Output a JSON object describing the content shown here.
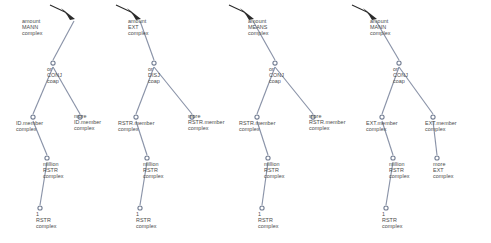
{
  "figure": {
    "type": "parse-tree-set",
    "tree_count": 4,
    "background_bleed_text": "the following image contains faint reverse-side text bleed-through from the scanned page"
  },
  "colors": {
    "edge": "#8a93a8",
    "node_stroke": "#6f7a90",
    "node_fill": "#ffffff",
    "root_marker": "#2b2b2b",
    "label_text": "#4a4a4a",
    "page_background": "#ffffff"
  },
  "trees": [
    {
      "id": "tree-1",
      "nodes": [
        {
          "id": "t1-root",
          "marker": "arrow",
          "x": 74,
          "y": 17,
          "label": [
            "amount",
            "MANN",
            "complex"
          ],
          "label_x": 22,
          "label_y": 18
        },
        {
          "id": "t1-or",
          "marker": "circle",
          "x": 53,
          "y": 63,
          "label": [
            "or",
            "CONJ",
            "coap"
          ],
          "label_x": 47,
          "label_y": 66
        },
        {
          "id": "t1-left",
          "marker": "circle",
          "x": 33,
          "y": 117,
          "label": [
            "ID.member",
            "complex"
          ],
          "label_x": 16,
          "label_y": 120
        },
        {
          "id": "t1-right",
          "marker": "circle",
          "x": 80,
          "y": 117,
          "label": [
            "more",
            "ID.member",
            "complex"
          ],
          "label_x": 74,
          "label_y": 113
        },
        {
          "id": "t1-million",
          "marker": "circle",
          "x": 47,
          "y": 158,
          "label": [
            "million",
            "RSTR",
            "complex"
          ],
          "label_x": 43,
          "label_y": 161
        },
        {
          "id": "t1-one",
          "marker": "circle",
          "x": 40,
          "y": 208,
          "label": [
            "1",
            "RSTR",
            "complex"
          ],
          "label_x": 36,
          "label_y": 211
        }
      ],
      "edges": [
        {
          "from": "t1-root",
          "to": "t1-or"
        },
        {
          "from": "t1-or",
          "to": "t1-left"
        },
        {
          "from": "t1-or",
          "to": "t1-right"
        },
        {
          "from": "t1-left",
          "to": "t1-million"
        },
        {
          "from": "t1-million",
          "to": "t1-one"
        }
      ]
    },
    {
      "id": "tree-2",
      "nodes": [
        {
          "id": "t2-root",
          "marker": "arrow",
          "x": 140,
          "y": 17,
          "label": [
            "amount",
            "EXT",
            "complex"
          ],
          "label_x": 128,
          "label_y": 18
        },
        {
          "id": "t2-or",
          "marker": "circle",
          "x": 154,
          "y": 63,
          "label": [
            "or",
            "DISJ",
            "coap"
          ],
          "label_x": 148,
          "label_y": 66
        },
        {
          "id": "t2-left",
          "marker": "circle",
          "x": 136,
          "y": 117,
          "label": [
            "RSTR.member",
            "complex"
          ],
          "label_x": 118,
          "label_y": 120
        },
        {
          "id": "t2-right",
          "marker": "circle",
          "x": 192,
          "y": 117,
          "label": [
            "more",
            "RSTR.member",
            "complex"
          ],
          "label_x": 188,
          "label_y": 113
        },
        {
          "id": "t2-million",
          "marker": "circle",
          "x": 147,
          "y": 158,
          "label": [
            "million",
            "RSTR",
            "complex"
          ],
          "label_x": 143,
          "label_y": 161
        },
        {
          "id": "t2-one",
          "marker": "circle",
          "x": 140,
          "y": 208,
          "label": [
            "1",
            "RSTR",
            "complex"
          ],
          "label_x": 136,
          "label_y": 211
        }
      ],
      "edges": [
        {
          "from": "t2-root",
          "to": "t2-or"
        },
        {
          "from": "t2-or",
          "to": "t2-left"
        },
        {
          "from": "t2-or",
          "to": "t2-right"
        },
        {
          "from": "t2-left",
          "to": "t2-million"
        },
        {
          "from": "t2-million",
          "to": "t2-one"
        }
      ]
    },
    {
      "id": "tree-3",
      "nodes": [
        {
          "id": "t3-root",
          "marker": "arrow",
          "x": 253,
          "y": 17,
          "label": [
            "amount",
            "MEANS",
            "complex"
          ],
          "label_x": 248,
          "label_y": 18
        },
        {
          "id": "t3-or",
          "marker": "circle",
          "x": 275,
          "y": 63,
          "label": [
            "or",
            "CONJ",
            "coap"
          ],
          "label_x": 269,
          "label_y": 66
        },
        {
          "id": "t3-left",
          "marker": "circle",
          "x": 257,
          "y": 117,
          "label": [
            "RSTR.member",
            "complex"
          ],
          "label_x": 239,
          "label_y": 120
        },
        {
          "id": "t3-right",
          "marker": "circle",
          "x": 313,
          "y": 117,
          "label": [
            "more",
            "RSTR.member",
            "complex"
          ],
          "label_x": 309,
          "label_y": 113
        },
        {
          "id": "t3-million",
          "marker": "circle",
          "x": 268,
          "y": 158,
          "label": [
            "million",
            "RSTR",
            "complex"
          ],
          "label_x": 264,
          "label_y": 161
        },
        {
          "id": "t3-one",
          "marker": "circle",
          "x": 262,
          "y": 208,
          "label": [
            "1",
            "RSTR",
            "complex"
          ],
          "label_x": 258,
          "label_y": 211
        }
      ],
      "edges": [
        {
          "from": "t3-root",
          "to": "t3-or"
        },
        {
          "from": "t3-or",
          "to": "t3-left"
        },
        {
          "from": "t3-or",
          "to": "t3-right"
        },
        {
          "from": "t3-left",
          "to": "t3-million"
        },
        {
          "from": "t3-million",
          "to": "t3-one"
        }
      ]
    },
    {
      "id": "tree-4",
      "nodes": [
        {
          "id": "t4-root",
          "marker": "arrow",
          "x": 376,
          "y": 17,
          "label": [
            "amount",
            "MANN",
            "complex"
          ],
          "label_x": 370,
          "label_y": 18
        },
        {
          "id": "t4-or",
          "marker": "circle",
          "x": 399,
          "y": 63,
          "label": [
            "or",
            "CONJ",
            "coap"
          ],
          "label_x": 393,
          "label_y": 66
        },
        {
          "id": "t4-left",
          "marker": "circle",
          "x": 382,
          "y": 117,
          "label": [
            "EXT.member",
            "complex"
          ],
          "label_x": 366,
          "label_y": 120
        },
        {
          "id": "t4-right",
          "marker": "circle",
          "x": 433,
          "y": 117,
          "label": [
            "EXT.member",
            "complex"
          ],
          "label_x": 425,
          "label_y": 120
        },
        {
          "id": "t4-million",
          "marker": "circle",
          "x": 393,
          "y": 158,
          "label": [
            "million",
            "RSTR",
            "complex"
          ],
          "label_x": 389,
          "label_y": 161
        },
        {
          "id": "t4-more-ext",
          "marker": "circle",
          "x": 437,
          "y": 158,
          "label": [
            "more",
            "EXT",
            "complex"
          ],
          "label_x": 433,
          "label_y": 161
        },
        {
          "id": "t4-one",
          "marker": "circle",
          "x": 386,
          "y": 208,
          "label": [
            "1",
            "RSTR",
            "complex"
          ],
          "label_x": 382,
          "label_y": 211
        }
      ],
      "edges": [
        {
          "from": "t4-root",
          "to": "t4-or"
        },
        {
          "from": "t4-or",
          "to": "t4-left"
        },
        {
          "from": "t4-or",
          "to": "t4-right"
        },
        {
          "from": "t4-left",
          "to": "t4-million"
        },
        {
          "from": "t4-right",
          "to": "t4-more-ext"
        },
        {
          "from": "t4-million",
          "to": "t4-one"
        }
      ]
    }
  ]
}
